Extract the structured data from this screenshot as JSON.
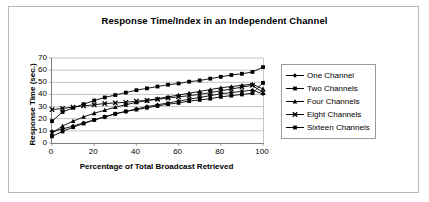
{
  "figure": {
    "background": "#ffffff",
    "border_color": "#b8b8b8"
  },
  "chart_data": {
    "type": "line",
    "title": "Response Time/Index in an Independent Channel",
    "xlabel": "Percentage of Total Broadcast Retrieved",
    "ylabel": "Response Time (sec.)",
    "xlim": [
      0,
      100
    ],
    "ylim": [
      0,
      70
    ],
    "xticks": [
      0,
      20,
      40,
      60,
      80,
      100
    ],
    "yticks": [
      0,
      10,
      20,
      30,
      40,
      50,
      60,
      70
    ],
    "grid": "horizontal",
    "legend_position": "right",
    "x": [
      0,
      5,
      10,
      15,
      20,
      25,
      30,
      35,
      40,
      45,
      50,
      55,
      60,
      65,
      70,
      75,
      80,
      85,
      90,
      95,
      100
    ],
    "series": [
      {
        "name": "One Channel",
        "marker": "diamond",
        "color": "#000000",
        "values": [
          9.5,
          11.5,
          14.0,
          16.5,
          19.0,
          21.5,
          24.0,
          26.0,
          28.0,
          30.0,
          31.5,
          33.0,
          34.5,
          36.0,
          37.5,
          39.0,
          40.5,
          41.5,
          42.5,
          43.5,
          40.5
        ]
      },
      {
        "name": "Two Channels",
        "marker": "square",
        "color": "#000000",
        "values": [
          18.0,
          25.5,
          29.0,
          32.0,
          35.0,
          37.5,
          39.5,
          41.5,
          43.5,
          45.0,
          46.5,
          48.0,
          49.0,
          50.5,
          51.5,
          53.0,
          54.5,
          56.0,
          57.0,
          58.5,
          62.5
        ]
      },
      {
        "name": "Four Channels",
        "marker": "triangle",
        "color": "#000000",
        "values": [
          8.0,
          14.0,
          18.0,
          21.5,
          24.5,
          27.0,
          29.5,
          31.5,
          33.5,
          35.0,
          36.5,
          38.0,
          39.5,
          41.0,
          42.5,
          44.0,
          45.5,
          46.5,
          47.5,
          48.5,
          44.5
        ]
      },
      {
        "name": "Eight Channels",
        "marker": "cross",
        "color": "#000000",
        "values": [
          27.5,
          28.5,
          29.5,
          30.5,
          31.5,
          32.5,
          33.0,
          33.5,
          34.5,
          35.0,
          36.0,
          37.0,
          38.0,
          39.0,
          40.0,
          41.5,
          43.0,
          44.5,
          46.0,
          47.5,
          41.5
        ]
      },
      {
        "name": "Sixteen Channels",
        "marker": "square-filled",
        "color": "#000000",
        "values": [
          5.5,
          9.5,
          13.0,
          16.0,
          19.0,
          21.5,
          24.0,
          26.0,
          27.5,
          29.0,
          30.5,
          32.0,
          33.0,
          34.5,
          35.5,
          36.5,
          38.0,
          39.0,
          40.0,
          41.0,
          49.5
        ]
      }
    ]
  }
}
